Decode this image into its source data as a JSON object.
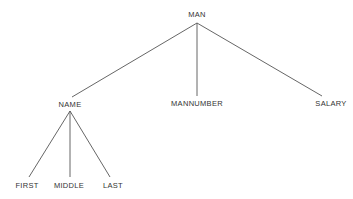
{
  "diagram": {
    "type": "tree",
    "nodes": [
      {
        "id": "man",
        "label": "MAN",
        "x": 197,
        "y": 14
      },
      {
        "id": "name",
        "label": "NAME",
        "x": 70,
        "y": 104
      },
      {
        "id": "mannumber",
        "label": "MANNUMBER",
        "x": 197,
        "y": 103
      },
      {
        "id": "salary",
        "label": "SALARY",
        "x": 331,
        "y": 103
      },
      {
        "id": "first",
        "label": "FIRST",
        "x": 27,
        "y": 185
      },
      {
        "id": "middle",
        "label": "MIDDLE",
        "x": 69,
        "y": 185
      },
      {
        "id": "last",
        "label": "LAST",
        "x": 113,
        "y": 185
      }
    ],
    "edges": [
      {
        "from": "man",
        "to": "name",
        "x1": 197,
        "y1": 23,
        "x2": 72,
        "y2": 97
      },
      {
        "from": "man",
        "to": "mannumber",
        "x1": 197,
        "y1": 23,
        "x2": 197,
        "y2": 96
      },
      {
        "from": "man",
        "to": "salary",
        "x1": 197,
        "y1": 23,
        "x2": 322,
        "y2": 96
      },
      {
        "from": "name",
        "to": "first",
        "x1": 70,
        "y1": 111,
        "x2": 29,
        "y2": 177
      },
      {
        "from": "name",
        "to": "middle",
        "x1": 70,
        "y1": 111,
        "x2": 70,
        "y2": 177
      },
      {
        "from": "name",
        "to": "last",
        "x1": 70,
        "y1": 111,
        "x2": 110,
        "y2": 177
      }
    ]
  }
}
